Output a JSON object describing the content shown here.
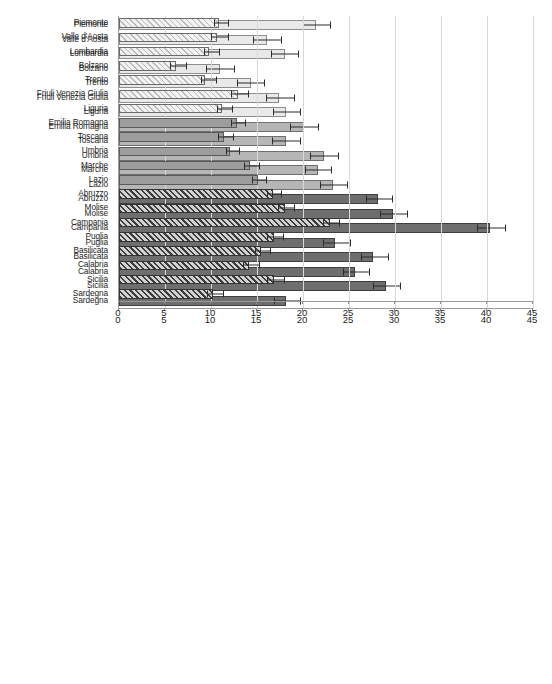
{
  "page": {
    "background": "#ffffff",
    "width": 552,
    "height": 684
  },
  "palette": {
    "north": "#e9e9e9",
    "center": "#b6b6b6",
    "south": "#6e6e6e",
    "gridline": "#d8d8d8",
    "axis": "#9a9a9a",
    "error_bar": "#2a2a2a",
    "text": "#1d1d1d"
  },
  "regions": [
    "Piemonte",
    "Valle d'Aosta",
    "Lombardia",
    "Bolzano",
    "Trento",
    "Friuli Venezia Giulia",
    "Liguria",
    "Emilia Romagna",
    "Toscana",
    "Umbria",
    "Marche",
    "Lazio",
    "Abruzzo",
    "Molise",
    "Campania",
    "Puglia",
    "Basilicata",
    "Calabria",
    "Sicilia",
    "Sardegna"
  ],
  "groups": [
    "north",
    "north",
    "north",
    "north",
    "north",
    "north",
    "north",
    "center",
    "center",
    "center",
    "center",
    "center",
    "south",
    "south",
    "south",
    "south",
    "south",
    "south",
    "south",
    "south"
  ],
  "chart_data": [
    {
      "id": "chart-top",
      "type": "bar",
      "orientation": "horizontal",
      "title": "",
      "xlabel": "",
      "ylabel": "",
      "xlim": [
        0,
        45
      ],
      "xticks": [
        0,
        5,
        10,
        15,
        20,
        25,
        30,
        35,
        40,
        45
      ],
      "grid": true,
      "legend": "none",
      "categories": [
        "Piemonte",
        "Valle d'Aosta",
        "Lombardia",
        "Bolzano",
        "Trento",
        "Friuli Venezia Giulia",
        "Liguria",
        "Emilia Romagna",
        "Toscana",
        "Umbria",
        "Marche",
        "Lazio",
        "Abruzzo",
        "Molise",
        "Campania",
        "Puglia",
        "Basilicata",
        "Calabria",
        "Sicilia",
        "Sardegna"
      ],
      "values": [
        21.4,
        16.1,
        18.0,
        11.0,
        14.3,
        17.4,
        18.1,
        20.1,
        18.1,
        22.3,
        21.6,
        23.3,
        28.1,
        29.8,
        40.3,
        23.5,
        27.6,
        25.7,
        29.0,
        18.2
      ],
      "err_low": [
        20.0,
        14.6,
        16.5,
        9.5,
        12.8,
        16.0,
        16.7,
        18.6,
        16.6,
        20.8,
        20.2,
        21.9,
        26.8,
        28.4,
        38.9,
        22.2,
        26.3,
        24.4,
        27.6,
        16.8
      ],
      "err_high": [
        22.9,
        17.6,
        19.5,
        12.5,
        15.8,
        19.0,
        19.7,
        21.6,
        19.7,
        23.8,
        23.0,
        24.8,
        29.7,
        31.3,
        42.0,
        25.1,
        29.2,
        27.2,
        30.5,
        19.7
      ]
    },
    {
      "id": "chart-bottom",
      "type": "bar",
      "orientation": "horizontal",
      "title": "",
      "xlabel": "",
      "ylabel": "",
      "xlim": [
        0,
        45
      ],
      "xticks": [
        0,
        5,
        10,
        15,
        20,
        25,
        30,
        35,
        40,
        45
      ],
      "grid": true,
      "legend": "none",
      "categories": [
        "Piemonte",
        "Valle d'Aosta",
        "Lombardia",
        "Bolzano",
        "Trento",
        "Friuli Venezia Giulia",
        "Liguria",
        "Emilia Romagna",
        "Toscana",
        "Umbria",
        "Marche",
        "Lazio",
        "Abruzzo",
        "Molise",
        "Campania",
        "Puglia",
        "Basilicata",
        "Calabria",
        "Sicilia",
        "Sardegna"
      ],
      "values": [
        10.9,
        10.7,
        9.8,
        6.2,
        9.4,
        12.9,
        11.2,
        12.8,
        11.4,
        12.1,
        14.2,
        15.1,
        16.7,
        18.0,
        22.9,
        16.8,
        15.4,
        14.1,
        16.8,
        10.2
      ],
      "err_low": [
        10.3,
        10.0,
        9.2,
        5.5,
        8.9,
        12.2,
        10.6,
        12.2,
        10.8,
        11.6,
        13.6,
        14.5,
        16.1,
        17.3,
        22.2,
        16.1,
        14.8,
        13.5,
        16.1,
        9.6
      ],
      "err_high": [
        11.9,
        11.8,
        10.9,
        7.3,
        10.5,
        14.0,
        12.3,
        13.7,
        12.4,
        13.0,
        15.2,
        16.0,
        17.6,
        19.0,
        23.9,
        17.8,
        16.4,
        15.2,
        17.9,
        11.3
      ]
    }
  ]
}
